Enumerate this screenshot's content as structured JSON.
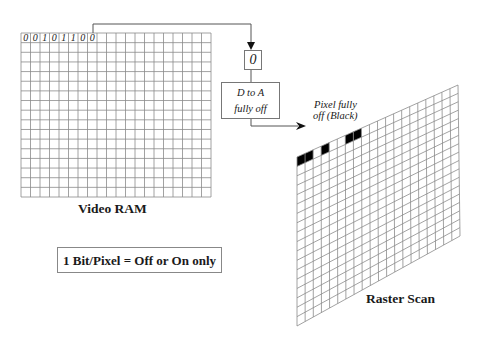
{
  "video_ram": {
    "label": "Video RAM",
    "bits": [
      "0",
      "0",
      "1",
      "0",
      "1",
      "1",
      "0",
      "0"
    ],
    "columns": 20,
    "rows": 17
  },
  "register": {
    "value": "0"
  },
  "dac": {
    "line1": "D to A",
    "line2": "fully off"
  },
  "pixel_note": {
    "line1": "Pixel fully",
    "line2": "off (Black)"
  },
  "raster": {
    "label": "Raster Scan",
    "columns": 20,
    "rows": 18,
    "black_cells_top_row": [
      0,
      1,
      3,
      6,
      7
    ]
  },
  "caption": {
    "text": "1 Bit/Pixel = Off or On only"
  },
  "colors": {
    "grid": "#8a8a8a",
    "line": "#555555",
    "pixel_off": "#000000"
  }
}
